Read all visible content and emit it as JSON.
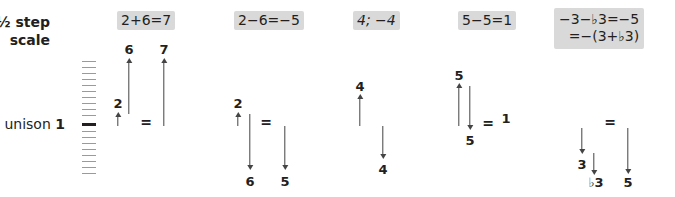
{
  "scale": {
    "title_line1": "½ step",
    "title_line2": "scale",
    "unison_word": "unison",
    "unison_number": "1",
    "line_count": 20
  },
  "panels": [
    {
      "equation": "2+6=7",
      "labels": {
        "a": "2",
        "b": "6",
        "result": "7",
        "equals": "="
      }
    },
    {
      "equation": "2−6=−5",
      "labels": {
        "a": "2",
        "b": "6",
        "result": "5",
        "equals": "="
      }
    },
    {
      "equation": "4; −4",
      "labels": {
        "up": "4",
        "down": "4"
      }
    },
    {
      "equation": "5−5=1",
      "labels": {
        "up": "5",
        "down": "5",
        "result": "1",
        "equals": "="
      }
    },
    {
      "equation_line1": "−3−♭3=−5",
      "equation_line2": "=−(3+♭3)",
      "labels": {
        "a": "3",
        "b": "♭3",
        "result": "5",
        "equals": "="
      }
    }
  ],
  "colors": {
    "badge_bg": "#d9d9d9",
    "text": "#231f20",
    "arrow": "#444444",
    "scale_tick": "#9a9a9a"
  }
}
